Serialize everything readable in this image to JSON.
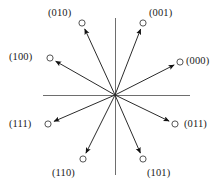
{
  "figure": {
    "type": "vector-constellation-diagram",
    "width": 221,
    "height": 188,
    "background_color": "#ffffff"
  },
  "axes": {
    "origin": {
      "x": 115,
      "y": 95
    },
    "horizontal": {
      "x1": 43,
      "y1": 95,
      "x2": 190,
      "y2": 95
    },
    "vertical": {
      "x1": 115,
      "y1": 18,
      "x2": 115,
      "y2": 175
    },
    "color": "#6e6e6e",
    "stroke_width": 1,
    "show_ticks": false,
    "show_grid": false,
    "tick_labels": []
  },
  "style": {
    "vector_color": "#2b2b2b",
    "vector_stroke_width": 1,
    "arrowhead_color": "#111111",
    "marker_fill": "#ffffff",
    "marker_stroke": "#555555",
    "marker_radius": 3.1,
    "label_color": "#1a1a1a"
  },
  "chart_data": {
    "type": "scatter",
    "title": "",
    "subtitle": "",
    "xlabel": "",
    "ylabel": "",
    "xlim": [
      -72,
      75
    ],
    "ylim": [
      -80,
      77
    ],
    "grid": false,
    "legend_position": "none",
    "origin_px": {
      "x": 115,
      "y": 95
    },
    "categories": [
      "(000)",
      "(001)",
      "(010)",
      "(011)",
      "(100)",
      "(101)",
      "(110)",
      "(111)"
    ],
    "series": [
      {
        "name": "signal vectors",
        "points": [
          {
            "label": "(000)",
            "x_px": 180,
            "y_px": 62,
            "dx": 65,
            "dy": 33,
            "angle_deg": 26.9,
            "magnitude": 72.9
          },
          {
            "label": "(001)",
            "x_px": 143,
            "y_px": 23,
            "dx": 28,
            "dy": 72,
            "angle_deg": 68.8,
            "magnitude": 77.3
          },
          {
            "label": "(010)",
            "x_px": 82,
            "y_px": 23,
            "dx": -33,
            "dy": 72,
            "angle_deg": 114.6,
            "magnitude": 79.2
          },
          {
            "label": "(011)",
            "x_px": 175,
            "y_px": 124,
            "dx": 60,
            "dy": -29,
            "angle_deg": -25.8,
            "magnitude": 66.6
          },
          {
            "label": "(100)",
            "x_px": 50,
            "y_px": 58,
            "dx": -65,
            "dy": 37,
            "angle_deg": 150.4,
            "magnitude": 74.8
          },
          {
            "label": "(101)",
            "x_px": 143,
            "y_px": 159,
            "dx": 28,
            "dy": -64,
            "angle_deg": -66.4,
            "magnitude": 69.9
          },
          {
            "label": "(110)",
            "x_px": 83,
            "y_px": 159,
            "dx": -32,
            "dy": -64,
            "angle_deg": -116.6,
            "magnitude": 71.6
          },
          {
            "label": "(111)",
            "x_px": 48,
            "y_px": 124,
            "dx": -67,
            "dy": -29,
            "angle_deg": -156.6,
            "magnitude": 73.0
          }
        ]
      }
    ]
  },
  "labels": [
    {
      "id": "label-010",
      "text": "(010)",
      "left": 48,
      "top": 7,
      "anchor": "upper-left"
    },
    {
      "id": "label-001",
      "text": "(001)",
      "left": 149,
      "top": 7,
      "anchor": "upper-right"
    },
    {
      "id": "label-100",
      "text": "(100)",
      "left": 9,
      "top": 51,
      "anchor": "left"
    },
    {
      "id": "label-000",
      "text": "(000)",
      "left": 186,
      "top": 55,
      "anchor": "right"
    },
    {
      "id": "label-111",
      "text": "(111)",
      "left": 9,
      "top": 118,
      "anchor": "left"
    },
    {
      "id": "label-011",
      "text": "(011)",
      "left": 184,
      "top": 118,
      "anchor": "right"
    },
    {
      "id": "label-110",
      "text": "(110)",
      "left": 52,
      "top": 167,
      "anchor": "lower-left"
    },
    {
      "id": "label-101",
      "text": "(101)",
      "left": 147,
      "top": 167,
      "anchor": "lower-right"
    }
  ]
}
